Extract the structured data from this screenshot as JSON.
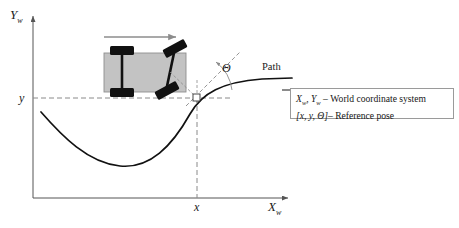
{
  "figure": {
    "background_color": "#ffffff",
    "width": 459,
    "height": 228
  },
  "axes": {
    "y_axis": {
      "name": "vertical-axis",
      "label_main": "Y",
      "label_sub": "w",
      "label_full": "Y_w",
      "color": "#555555"
    },
    "x_axis": {
      "name": "horizontal-axis",
      "label_main": "X",
      "label_sub": "w",
      "label_full": "X_w",
      "color": "#555555"
    }
  },
  "ticks": {
    "y_tick": "y",
    "x_tick": "x"
  },
  "annotations": {
    "theta": "Θ",
    "path_label": "Path",
    "heading_arrow": "direction-of-travel-arrow"
  },
  "legend": {
    "rows": [
      {
        "symbol_main_1": "X",
        "symbol_sub_1": "w",
        "symbol_main_2": "Y",
        "symbol_sub_2": "w",
        "separator": "–",
        "description": "World coordinate system",
        "full_text": "X_w, Y_w – World coordinate system"
      },
      {
        "symbol": "[x, y, Θ]",
        "separator": "–",
        "description": "Reference pose",
        "full_text": "[x, y, Θ] – Reference pose"
      }
    ],
    "border_color": "#9a9a9a"
  },
  "vehicle": {
    "name": "car-like-robot",
    "body_fill": "#c3c3c3",
    "body_stroke": "#8f8f8f",
    "wheel_fill": "#111111",
    "axle_color": "#111111",
    "steering_angle_deg": 28
  },
  "path": {
    "name": "reference-path-curve",
    "stroke": "#111111",
    "stroke_width": 1.6
  },
  "guides": {
    "dash_color": "#8a8a8a",
    "tangent_color": "#8a8a8a"
  },
  "colors": {
    "ink": "#1a1a1a",
    "axis": "#555555",
    "gray_arrow": "#8c8c8c"
  }
}
